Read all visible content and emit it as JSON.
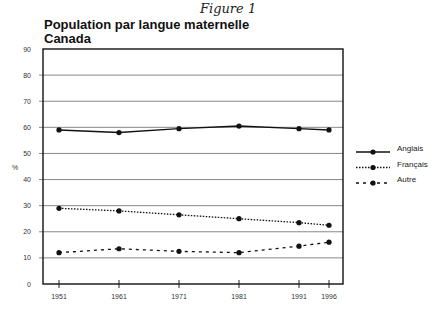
{
  "figure_label": "Figure 1",
  "title": "Population par langue maternelle",
  "subtitle": "Canada",
  "chart_data": {
    "type": "line",
    "title": "Population par langue maternelle",
    "subtitle": "Canada",
    "xlabel": "",
    "ylabel": "%",
    "ylim": [
      0,
      90
    ],
    "yticks": [
      0,
      10,
      20,
      30,
      40,
      50,
      60,
      70,
      80,
      90
    ],
    "x": [
      1951,
      1961,
      1971,
      1981,
      1991,
      1996
    ],
    "grid": true,
    "legend_position": "right",
    "series": [
      {
        "name": "Anglais",
        "style": "solid",
        "values": [
          59,
          58,
          59.5,
          60.5,
          59.5,
          59
        ]
      },
      {
        "name": "Français",
        "style": "dotted",
        "values": [
          29,
          28,
          26.5,
          25,
          23.5,
          22.5
        ]
      },
      {
        "name": "Autre",
        "style": "dashed",
        "values": [
          12,
          13.5,
          12.5,
          12,
          14.5,
          16
        ]
      }
    ]
  }
}
